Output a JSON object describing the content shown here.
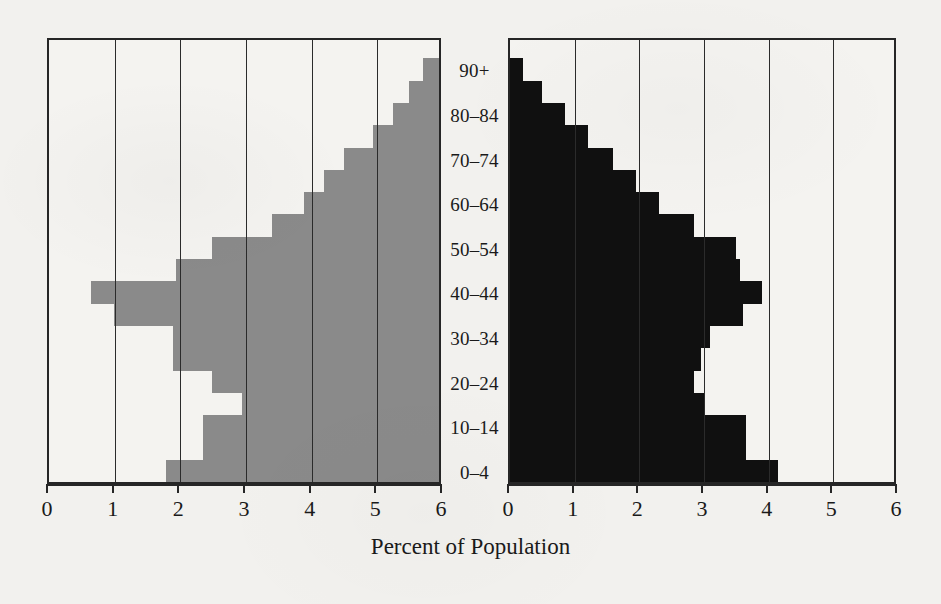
{
  "chart_data": {
    "type": "bar",
    "subtype": "population-pyramid",
    "title": "",
    "xlabel": "Percent of Population",
    "ylabel": "",
    "xlim": [
      0,
      6
    ],
    "grid": true,
    "legend": false,
    "axis": {
      "left_panel_ticks": [
        "6",
        "5",
        "4",
        "3",
        "2",
        "1",
        "0"
      ],
      "right_panel_ticks": [
        "0",
        "1",
        "2",
        "3",
        "4",
        "5",
        "6"
      ],
      "left_panel_tick_values": [
        6,
        5,
        4,
        3,
        2,
        1,
        0
      ],
      "right_panel_tick_values": [
        0,
        1,
        2,
        3,
        4,
        5,
        6
      ],
      "direction_left": "descending",
      "direction_right": "ascending"
    },
    "categories": [
      "0–4",
      "5–9",
      "10–14",
      "15–19",
      "20–24",
      "25–29",
      "30–34",
      "35–39",
      "40–44",
      "45–49",
      "50–54",
      "55–59",
      "60–64",
      "65–69",
      "70–74",
      "75–79",
      "80–84",
      "85–89",
      "90+"
    ],
    "visible_category_labels": [
      "0–4",
      "10–14",
      "20–24",
      "30–34",
      "40–44",
      "50–54",
      "60–64",
      "70–74",
      "80–84",
      "90+"
    ],
    "series": [
      {
        "name": "left",
        "color": "#8a8a8a",
        "panel": "left",
        "values": [
          4.15,
          3.6,
          3.6,
          3.0,
          3.45,
          4.05,
          4.05,
          4.95,
          5.3,
          4.0,
          3.45,
          2.55,
          2.05,
          1.75,
          1.45,
          1.0,
          0.7,
          0.45,
          0.25
        ]
      },
      {
        "name": "right",
        "color": "#101010",
        "panel": "right",
        "values": [
          4.15,
          3.65,
          3.65,
          3.0,
          2.85,
          2.95,
          3.1,
          3.6,
          3.9,
          3.55,
          3.5,
          2.85,
          2.3,
          1.95,
          1.6,
          1.2,
          0.85,
          0.5,
          0.2
        ]
      }
    ]
  },
  "figure": {
    "xaxis_title": "Percent of Population"
  }
}
